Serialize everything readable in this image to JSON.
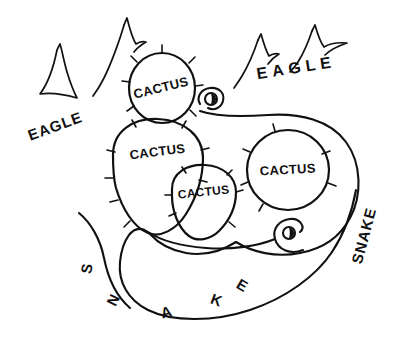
{
  "figure": {
    "background_color": "#ffffff",
    "ink_color": "#111111",
    "width": 396,
    "height": 340
  },
  "labels": {
    "cactus_top": "CACTUS",
    "cactus_left": "CACTUS",
    "cactus_center": "CACTUS",
    "cactus_right": "CACTUS",
    "snake_bottom_s": "S",
    "snake_bottom_n": "N",
    "snake_bottom_a": "A",
    "snake_bottom_k": "K",
    "snake_bottom_e": "E",
    "snake_right": "SNAKE",
    "eagle_left": "EAGLE",
    "eagle_right": "EAGLE"
  },
  "elements": {
    "cacti_count": 4,
    "eagles_count": 4,
    "snake_heads_count": 2
  }
}
